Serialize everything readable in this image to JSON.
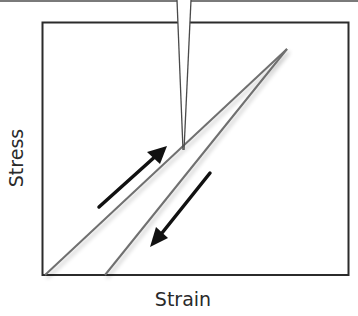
{
  "diagram": {
    "title": "",
    "x_axis_label": "Strain",
    "y_axis_label": "Stress",
    "colors": {
      "frame": "#2b2b2b",
      "curve": "#6f6f6f",
      "arrow": "#111111",
      "needle": "#4a4a4a",
      "top_rule": "#7a7a7a"
    },
    "elements": {
      "indenter_needle": {
        "label": "indenter tip",
        "tip": [
          183,
          150
        ]
      },
      "loading_curve": {
        "label": "loading",
        "from": [
          45,
          275
        ],
        "to": [
          287,
          49
        ]
      },
      "unloading_curve": {
        "label": "unloading",
        "from": [
          287,
          49
        ],
        "to": [
          105,
          275
        ]
      },
      "loading_arrow": {
        "direction": "up-right"
      },
      "unloading_arrow": {
        "direction": "down-left"
      }
    }
  }
}
